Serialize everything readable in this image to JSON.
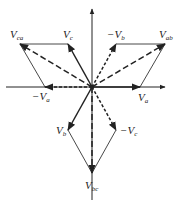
{
  "diagram": {
    "type": "phasor-diagram",
    "origin": [
      92,
      87
    ],
    "colors": {
      "line": "#222222",
      "background": "#ffffff"
    },
    "labels": {
      "Va": {
        "base": "V",
        "sub": "a",
        "prefix": ""
      },
      "negVa": {
        "base": "V",
        "sub": "a",
        "prefix": "−"
      },
      "Vb": {
        "base": "V",
        "sub": "b",
        "prefix": ""
      },
      "negVb": {
        "base": "V",
        "sub": "b",
        "prefix": "−"
      },
      "Vc": {
        "base": "V",
        "sub": "c",
        "prefix": ""
      },
      "negVc": {
        "base": "V",
        "sub": "c",
        "prefix": "−"
      },
      "Vab": {
        "base": "V",
        "sub": "ab",
        "prefix": ""
      },
      "Vbc": {
        "base": "V",
        "sub": "bc",
        "prefix": ""
      },
      "Vca": {
        "base": "V",
        "sub": "ca",
        "prefix": ""
      }
    },
    "phasors": [
      {
        "id": "Va",
        "style": "solid",
        "to": [
          140,
          87
        ]
      },
      {
        "id": "Vb",
        "style": "solid",
        "to": [
          68,
          130
        ]
      },
      {
        "id": "Vc",
        "style": "solid",
        "to": [
          68,
          44
        ]
      },
      {
        "id": "negVa",
        "style": "dashed",
        "to": [
          45,
          87
        ]
      },
      {
        "id": "negVb",
        "style": "dashed",
        "to": [
          116,
          44
        ]
      },
      {
        "id": "negVc",
        "style": "dashed",
        "to": [
          116,
          130
        ]
      },
      {
        "id": "Vab",
        "style": "dashed",
        "to": [
          165,
          44
        ]
      },
      {
        "id": "Vbc",
        "style": "dashed",
        "to": [
          92,
          173
        ]
      },
      {
        "id": "Vca",
        "style": "dashed",
        "to": [
          20,
          44
        ]
      }
    ]
  }
}
